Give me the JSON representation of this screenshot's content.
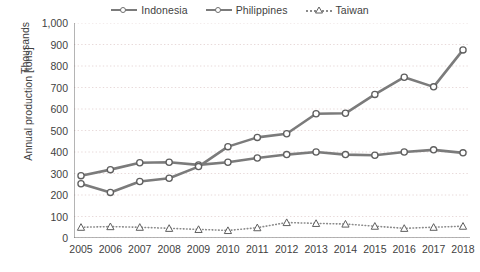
{
  "chart_data": {
    "type": "line",
    "title": "",
    "xlabel": "",
    "ylabel": "Annual production [tons]",
    "y_unit_label": "Thousands",
    "grid": true,
    "legend_position": "top-center",
    "xlim": [
      2005,
      2018
    ],
    "ylim": [
      0,
      1000
    ],
    "y_ticks": [
      "0",
      "100",
      "200",
      "300",
      "400",
      "500",
      "600",
      "700",
      "800",
      "900",
      "1,000"
    ],
    "categories": [
      "2005",
      "2006",
      "2007",
      "2008",
      "2009",
      "2010",
      "2011",
      "2012",
      "2013",
      "2014",
      "2015",
      "2016",
      "2017",
      "2018"
    ],
    "series": [
      {
        "name": "Indonesia",
        "marker": "circle",
        "line_style": "solid",
        "color": "#7b7b7b",
        "values": [
          290,
          318,
          350,
          352,
          340,
          352,
          372,
          388,
          400,
          388,
          385,
          400,
          410,
          396
        ]
      },
      {
        "name": "Philippines",
        "marker": "circle",
        "line_style": "solid",
        "color": "#7b7b7b",
        "values": [
          252,
          212,
          263,
          278,
          332,
          425,
          468,
          485,
          578,
          580,
          668,
          748,
          703,
          875
        ]
      },
      {
        "name": "Taiwan",
        "marker": "triangle",
        "line_style": "dotted",
        "color": "#8a8a8a",
        "values": [
          50,
          53,
          50,
          45,
          40,
          35,
          48,
          72,
          68,
          65,
          55,
          45,
          50,
          55
        ]
      }
    ]
  },
  "legend": {
    "items": [
      {
        "label": "Indonesia"
      },
      {
        "label": "Philippines"
      },
      {
        "label": "Taiwan"
      }
    ]
  },
  "colors": {
    "line": "#7b7b7b",
    "marker_fill": "#ffffff",
    "marker_stroke": "#5f5f5f",
    "grid": "#e8dada",
    "axis": "#6b6b6b",
    "text": "#3f3f3f",
    "background": "#ffffff"
  }
}
